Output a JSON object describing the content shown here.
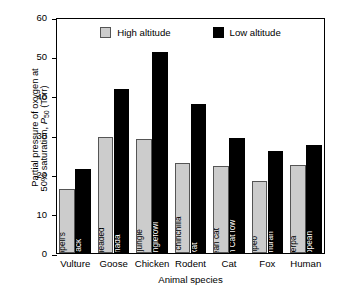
{
  "axes": {
    "ylabel_line1": "Partial pressure of oxygen at",
    "ylabel_line2_pre": "50% saturation, ",
    "ylabel_p": "P",
    "ylabel_sub": "50",
    "ylabel_unit": " (Torr)",
    "xlabel": "Animal species",
    "yticks": [
      "0",
      "10",
      "20",
      "30",
      "40",
      "50",
      "60"
    ]
  },
  "legend": {
    "high_label": "High altitude",
    "low_label": "Low altitude",
    "high_color": "#cccccc",
    "low_color": "#000000"
  },
  "chart_data": {
    "type": "bar",
    "title": "",
    "xlabel": "Animal species",
    "ylabel": "Partial pressure of oxygen at 50% saturation, P50 (Torr)",
    "ylim": [
      0,
      60
    ],
    "ytick_values": [
      0,
      10,
      20,
      30,
      40,
      50,
      60
    ],
    "grid": false,
    "legend_position": "top-center",
    "categories": [
      "Vulture",
      "Goose",
      "Chicken",
      "Rodent",
      "Cat",
      "Fox",
      "Human"
    ],
    "series": [
      {
        "name": "High altitude",
        "color": "#cccccc",
        "values": [
          16.3,
          29.6,
          29.0,
          22.9,
          22.2,
          18.3,
          22.3
        ],
        "bar_labels": [
          "Ruppell's",
          "Bar-headed",
          "Red jungle",
          "Andean chinchilla",
          "Andean cat",
          "Culpeo",
          "Sherpa"
        ]
      },
      {
        "name": "Low altitude",
        "color": "#000000",
        "values": [
          21.3,
          41.8,
          51.0,
          38.0,
          29.2,
          26.0,
          27.5
        ],
        "bar_labels": [
          "Black",
          "Canada",
          "Red junglefowl",
          "Rat",
          "Andean Cat low",
          "Sechuran",
          "European"
        ]
      }
    ]
  }
}
